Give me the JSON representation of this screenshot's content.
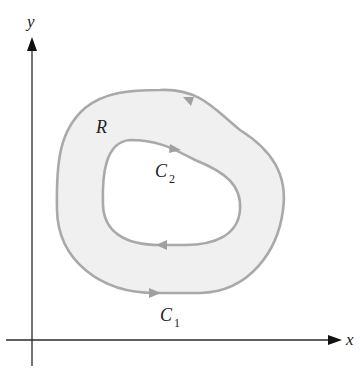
{
  "diagram": {
    "axes": {
      "x_label": "x",
      "y_label": "y"
    },
    "region": {
      "label": "R"
    },
    "curves": [
      {
        "id": "C1",
        "label_main": "C",
        "label_sub": "1",
        "role": "outer boundary",
        "orientation": "counterclockwise"
      },
      {
        "id": "C2",
        "label_main": "C",
        "label_sub": "2",
        "role": "inner boundary",
        "orientation": "clockwise"
      }
    ],
    "colors": {
      "region_fill": "#f0f0f0",
      "boundary_stroke": "#a9a9a9",
      "axis": "#2a2a2a",
      "text": "#222222"
    }
  }
}
